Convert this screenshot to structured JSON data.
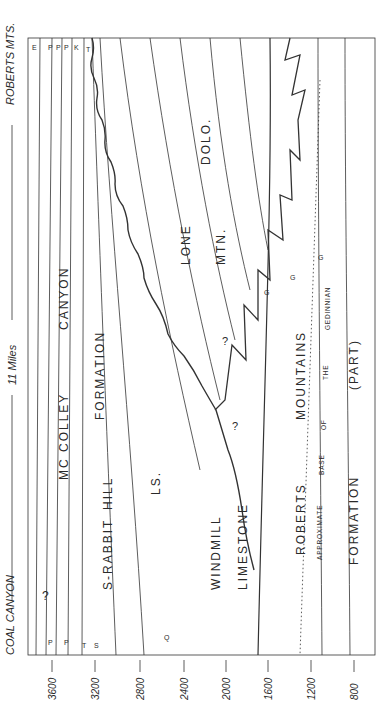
{
  "figure": {
    "orientation": "rotated-90-ccw",
    "endpoints": {
      "left": "COAL CANYON",
      "right": "ROBERTS MTS."
    },
    "distance_label": "11 Miles",
    "scale": {
      "unit": "feet",
      "ticks": [
        "3600",
        "3200",
        "2800",
        "2400",
        "2000",
        "1600",
        "1200",
        "800"
      ]
    },
    "formations": [
      {
        "id": "mccolley",
        "words": [
          "MC COLLEY",
          "CANYON",
          "FORMATION"
        ]
      },
      {
        "id": "rabbit-hill",
        "words": [
          "S-RABBIT",
          "HILL",
          "LS."
        ]
      },
      {
        "id": "windmill",
        "words": [
          "WINDMILL",
          "LIMESTONE"
        ]
      },
      {
        "id": "lone-mtn",
        "words": [
          "LONE",
          "MTN.",
          "DOLO."
        ]
      },
      {
        "id": "roberts-mtns",
        "words": [
          "ROBERTS",
          "MOUNTAINS",
          "FORMATION",
          "(PART)"
        ]
      }
    ],
    "datum_line": {
      "label_parts": [
        "APPROXIMATE",
        "BASE",
        "OF",
        "THE",
        "GEDINNIAN"
      ]
    },
    "fossil_markers": {
      "coal_canyon": [
        "P",
        "P",
        "T",
        "S",
        "S",
        "S",
        "Q",
        "G"
      ],
      "roberts_mts": [
        "E",
        "P",
        "P",
        "P",
        "K",
        "T"
      ],
      "lone_mtn_base": [
        "G",
        "G",
        "G"
      ]
    },
    "uncertain": "?"
  }
}
